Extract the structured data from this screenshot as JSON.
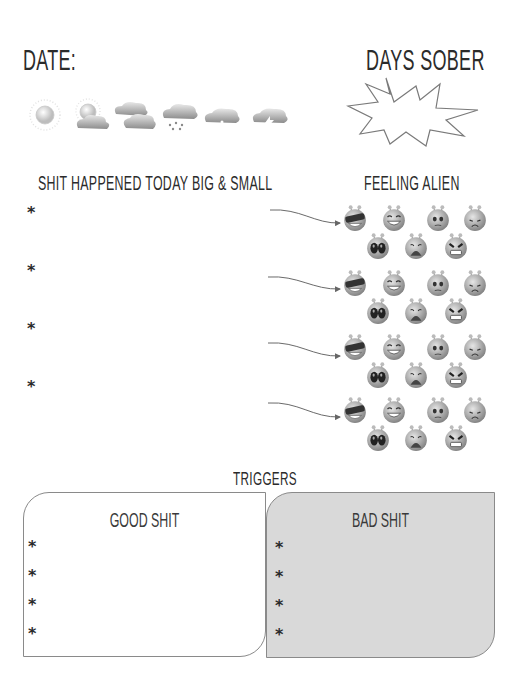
{
  "header": {
    "date_label": "Date:",
    "days_sober_label": "Days Sober"
  },
  "weather": {
    "icons": [
      "sunny-icon",
      "partly-cloudy-icon",
      "cloudy-icon",
      "rain-icon",
      "snow-icon",
      "storm-icon"
    ]
  },
  "events": {
    "title": "Shit Happened Today Big & Small",
    "bullets": [
      "*",
      "*",
      "*",
      "*"
    ]
  },
  "feeling": {
    "title": "Feeling alien",
    "faces": [
      "cool-alien",
      "laughing-alien",
      "worried-alien",
      "sad-alien",
      "scared-alien",
      "crying-alien",
      "angry-alien"
    ]
  },
  "triggers": {
    "title": "Triggers",
    "good": {
      "title": "Good shit",
      "bullets": [
        "*",
        "*",
        "*",
        "*"
      ]
    },
    "bad": {
      "title": "Bad Shit",
      "bullets": [
        "*",
        "*",
        "*",
        "*"
      ]
    }
  },
  "colors": {
    "text": "#2a2a2a",
    "bad_fill": "#d9d9d9",
    "border": "#8a8a8a"
  }
}
